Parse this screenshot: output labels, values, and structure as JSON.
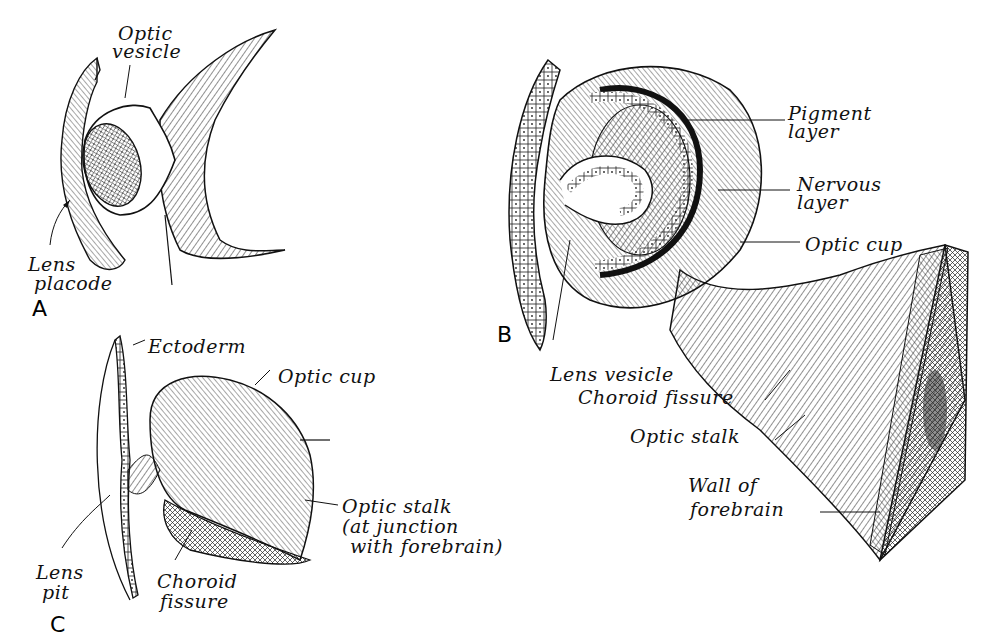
{
  "panels": {
    "A": {
      "letter": "A",
      "labels": {
        "optic_vesicle_1": "Optic",
        "optic_vesicle_2": "vesicle",
        "lens_placode_1": "Lens",
        "lens_placode_2": "placode"
      }
    },
    "B": {
      "letter": "B",
      "labels": {
        "pigment_layer_1": "Pigment",
        "pigment_layer_2": "layer",
        "nervous_layer_1": "Nervous",
        "nervous_layer_2": "layer",
        "optic_cup": "Optic cup",
        "lens_vesicle": "Lens vesicle",
        "choroid_fissure": "Choroid fissure",
        "optic_stalk": "Optic stalk",
        "wall_1": "Wall of",
        "wall_2": "forebrain"
      }
    },
    "C": {
      "letter": "C",
      "labels": {
        "ectoderm": "Ectoderm",
        "optic_cup": "Optic cup",
        "optic_stalk_1": "Optic stalk",
        "optic_stalk_2": "(at junction",
        "optic_stalk_3": "with forebrain)",
        "lens_pit_1": "Lens",
        "lens_pit_2": "pit",
        "choroid_1": "Choroid",
        "choroid_2": "fissure"
      }
    }
  },
  "colors": {
    "ink": "#111111",
    "paper": "#ffffff"
  }
}
